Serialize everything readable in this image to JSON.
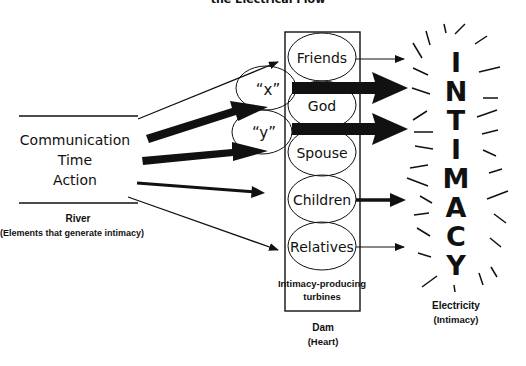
{
  "diagram": {
    "title_fragment": "the Electrical Flow",
    "river": {
      "items": [
        "Communication",
        "Time",
        "Action"
      ],
      "label": "River",
      "sublabel": "(Elements that generate intimacy)"
    },
    "intermediates": [
      {
        "id": "x",
        "label": "“x”"
      },
      {
        "id": "y",
        "label": "“y”"
      }
    ],
    "turbines": [
      {
        "id": "friends",
        "label": "Friends"
      },
      {
        "id": "god",
        "label": "God"
      },
      {
        "id": "spouse",
        "label": "Spouse"
      },
      {
        "id": "children",
        "label": "Children"
      },
      {
        "id": "relatives",
        "label": "Relatives"
      }
    ],
    "turbine_caption_line1": "Intimacy-producing",
    "turbine_caption_line2": "turbines",
    "dam": {
      "label": "Dam",
      "sublabel": "(Heart)"
    },
    "intimacy_letters": [
      "I",
      "N",
      "T",
      "I",
      "M",
      "A",
      "C",
      "Y"
    ],
    "electricity": {
      "label": "Electricity",
      "sublabel": "(Intimacy)"
    },
    "colors": {
      "ink": "#111111",
      "background": "#ffffff"
    }
  }
}
